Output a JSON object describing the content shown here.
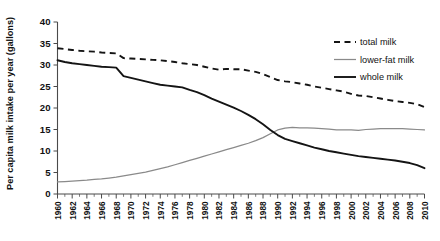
{
  "chart_data": {
    "type": "line",
    "title": "",
    "xlabel": "",
    "ylabel": "Per capita milk intake per year (gallons)",
    "ylim": [
      0,
      40
    ],
    "xlim": [
      1960,
      2010
    ],
    "ytick_labels": [
      "0",
      "5",
      "10",
      "15",
      "20",
      "25",
      "30",
      "35",
      "40"
    ],
    "ytick_values": [
      0,
      5,
      10,
      15,
      20,
      25,
      30,
      35,
      40
    ],
    "grid": false,
    "legend_position": "top-right",
    "x": [
      1960,
      1961,
      1962,
      1963,
      1964,
      1965,
      1966,
      1967,
      1968,
      1969,
      1970,
      1971,
      1972,
      1973,
      1974,
      1975,
      1976,
      1977,
      1978,
      1979,
      1980,
      1981,
      1982,
      1983,
      1984,
      1985,
      1986,
      1987,
      1988,
      1989,
      1990,
      1991,
      1992,
      1993,
      1994,
      1995,
      1996,
      1997,
      1998,
      1999,
      2000,
      2001,
      2002,
      2003,
      2004,
      2005,
      2006,
      2007,
      2008,
      2009,
      2010
    ],
    "xtick_labels": [
      "1960",
      "1962",
      "1964",
      "1966",
      "1968",
      "1970",
      "1972",
      "1974",
      "1976",
      "1978",
      "1980",
      "1982",
      "1984",
      "1986",
      "1988",
      "1990",
      "1992",
      "1994",
      "1996",
      "1998",
      "2000",
      "2002",
      "2004",
      "2006",
      "2008",
      "2010"
    ],
    "xtick_values": [
      1960,
      1962,
      1964,
      1966,
      1968,
      1970,
      1972,
      1974,
      1976,
      1978,
      1980,
      1982,
      1984,
      1986,
      1988,
      1990,
      1992,
      1994,
      1996,
      1998,
      2000,
      2002,
      2004,
      2006,
      2008,
      2010
    ],
    "series": [
      {
        "name": "total milk",
        "style": "dashed",
        "color": "#141414",
        "values": [
          33.9,
          33.7,
          33.5,
          33.3,
          33.2,
          33.1,
          32.9,
          32.8,
          32.7,
          31.6,
          31.5,
          31.4,
          31.3,
          31.2,
          31.1,
          30.9,
          30.7,
          30.4,
          30.2,
          30.0,
          29.6,
          29.2,
          28.9,
          29.1,
          29.0,
          29.0,
          28.7,
          28.4,
          27.9,
          27.2,
          26.5,
          26.2,
          26.0,
          25.7,
          25.4,
          25.0,
          24.7,
          24.4,
          24.1,
          23.8,
          23.3,
          22.9,
          22.8,
          22.5,
          22.2,
          21.9,
          21.6,
          21.4,
          21.2,
          20.9,
          20.2
        ]
      },
      {
        "name": "lower-fat milk",
        "style": "solid-thin",
        "color": "#8a8a8a",
        "values": [
          2.8,
          2.9,
          3.0,
          3.1,
          3.2,
          3.4,
          3.5,
          3.7,
          3.9,
          4.2,
          4.5,
          4.8,
          5.1,
          5.5,
          5.9,
          6.3,
          6.8,
          7.3,
          7.8,
          8.3,
          8.8,
          9.3,
          9.8,
          10.3,
          10.8,
          11.3,
          11.8,
          12.4,
          13.1,
          14.0,
          14.9,
          15.3,
          15.5,
          15.4,
          15.4,
          15.3,
          15.2,
          15.1,
          14.9,
          14.9,
          14.9,
          14.8,
          15.0,
          15.1,
          15.2,
          15.2,
          15.2,
          15.2,
          15.1,
          15.0,
          14.9
        ]
      },
      {
        "name": "whole milk",
        "style": "solid-thick",
        "color": "#141414",
        "values": [
          31.1,
          30.7,
          30.4,
          30.2,
          30.0,
          29.8,
          29.6,
          29.5,
          29.4,
          27.4,
          27.0,
          26.6,
          26.2,
          25.8,
          25.4,
          25.2,
          25.0,
          24.8,
          24.2,
          23.7,
          23.0,
          22.2,
          21.5,
          20.8,
          20.1,
          19.3,
          18.4,
          17.4,
          16.2,
          14.9,
          13.7,
          12.8,
          12.3,
          11.8,
          11.3,
          10.8,
          10.4,
          10.0,
          9.7,
          9.4,
          9.1,
          8.8,
          8.6,
          8.4,
          8.2,
          8.0,
          7.8,
          7.5,
          7.2,
          6.7,
          6.0
        ]
      }
    ]
  },
  "legend": {
    "items": [
      {
        "label": "total milk",
        "key": "total"
      },
      {
        "label": "lower-fat milk",
        "key": "lowerfat"
      },
      {
        "label": "whole milk",
        "key": "whole"
      }
    ]
  }
}
